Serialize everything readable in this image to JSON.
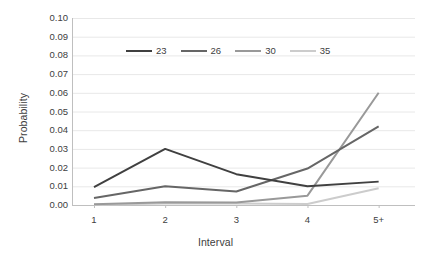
{
  "chart_data": {
    "type": "line",
    "title": "",
    "xlabel": "Interval",
    "ylabel": "Probability",
    "categories": [
      "1",
      "2",
      "3",
      "4",
      "5+"
    ],
    "ylim": [
      0.0,
      0.1
    ],
    "ytick_step": 0.01,
    "yticks": [
      "0.10",
      "0.09",
      "0.08",
      "0.07",
      "0.06",
      "0.05",
      "0.04",
      "0.03",
      "0.02",
      "0.01",
      "0.00"
    ],
    "ytick_values": [
      0.1,
      0.09,
      0.08,
      0.07,
      0.06,
      0.05,
      0.04,
      0.03,
      0.02,
      0.01,
      0.0
    ],
    "grid": "horizontal",
    "legend_position": "top-center",
    "series": [
      {
        "name": "23",
        "color": "#404040",
        "values": [
          0.0095,
          0.03,
          0.0165,
          0.01,
          0.0125
        ]
      },
      {
        "name": "26",
        "color": "#666666",
        "values": [
          0.0038,
          0.01,
          0.0072,
          0.0195,
          0.042
        ]
      },
      {
        "name": "30",
        "color": "#999999",
        "values": [
          0.0004,
          0.0015,
          0.0013,
          0.005,
          0.06
        ]
      },
      {
        "name": "35",
        "color": "#cccccc",
        "values": [
          0.0002,
          0.0008,
          0.0008,
          0.0005,
          0.009
        ]
      }
    ]
  },
  "axes": {
    "axis_line_color": "#bfbfbf",
    "grid_color": "#e8e8e8"
  }
}
